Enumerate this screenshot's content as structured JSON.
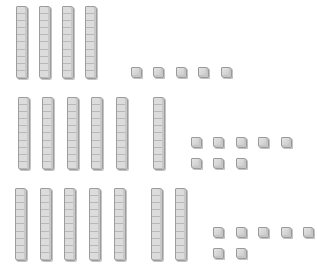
{
  "diagram": {
    "type": "base-ten-blocks",
    "colors": {
      "block_fill": "#dcdcdc",
      "block_border": "#9c9c9c",
      "background": "#ffffff"
    },
    "groups": [
      {
        "name": "row-1",
        "tens": 4,
        "ones": 5,
        "value": 45,
        "rods": [
          {
            "x": 16,
            "y": 6
          },
          {
            "x": 39,
            "y": 6
          },
          {
            "x": 62,
            "y": 6
          },
          {
            "x": 85,
            "y": 6
          }
        ],
        "cubes": [
          {
            "x": 131,
            "y": 67
          },
          {
            "x": 153,
            "y": 67
          },
          {
            "x": 176,
            "y": 67
          },
          {
            "x": 198,
            "y": 67
          },
          {
            "x": 221,
            "y": 67
          }
        ]
      },
      {
        "name": "row-2",
        "tens": 6,
        "ones": 8,
        "value": 68,
        "rods": [
          {
            "x": 18,
            "y": 97
          },
          {
            "x": 42,
            "y": 97
          },
          {
            "x": 67,
            "y": 97
          },
          {
            "x": 91,
            "y": 97
          },
          {
            "x": 116,
            "y": 97
          },
          {
            "x": 153,
            "y": 97
          }
        ],
        "cubes": [
          {
            "x": 191,
            "y": 137
          },
          {
            "x": 213,
            "y": 137
          },
          {
            "x": 236,
            "y": 137
          },
          {
            "x": 258,
            "y": 137
          },
          {
            "x": 281,
            "y": 137
          },
          {
            "x": 191,
            "y": 158
          },
          {
            "x": 213,
            "y": 158
          },
          {
            "x": 236,
            "y": 158
          }
        ]
      },
      {
        "name": "row-3",
        "tens": 7,
        "ones": 7,
        "value": 77,
        "rods": [
          {
            "x": 15,
            "y": 188
          },
          {
            "x": 40,
            "y": 188
          },
          {
            "x": 64,
            "y": 188
          },
          {
            "x": 89,
            "y": 188
          },
          {
            "x": 114,
            "y": 188
          },
          {
            "x": 151,
            "y": 188
          },
          {
            "x": 175,
            "y": 188
          }
        ],
        "cubes": [
          {
            "x": 213,
            "y": 227
          },
          {
            "x": 236,
            "y": 227
          },
          {
            "x": 258,
            "y": 227
          },
          {
            "x": 281,
            "y": 227
          },
          {
            "x": 303,
            "y": 227
          },
          {
            "x": 213,
            "y": 248
          },
          {
            "x": 236,
            "y": 248
          }
        ]
      }
    ]
  }
}
